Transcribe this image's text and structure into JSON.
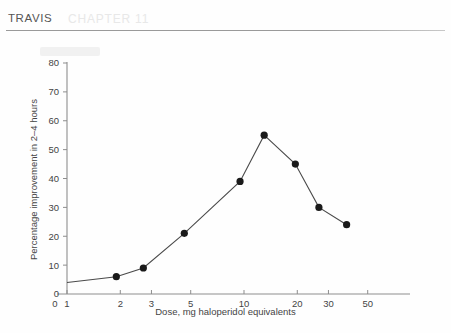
{
  "page": {
    "running_head": "TRAVIS",
    "ghost_watermark": "CHAPTER 11",
    "background_color": "#fefefe",
    "rule_color": "#9a9a9a"
  },
  "chart_data": {
    "type": "line",
    "title": "",
    "subtitle": "",
    "xlabel": "Dose, mg haloperidol equivalents",
    "ylabel": "Percentage improvement in 2–4 hours",
    "xscale": "log",
    "yscale": "linear",
    "xlim": [
      1,
      60
    ],
    "ylim": [
      0,
      80
    ],
    "x_origin_label": "0",
    "xticks": [
      1,
      2,
      3,
      5,
      10,
      20,
      30,
      50
    ],
    "xtick_labels": [
      "1",
      "2",
      "3",
      "5",
      "10",
      "20",
      "30",
      "50"
    ],
    "yticks": [
      0,
      10,
      20,
      30,
      40,
      50,
      60,
      70,
      80
    ],
    "ytick_labels": [
      "0",
      "10",
      "20",
      "30",
      "40",
      "50",
      "60",
      "70",
      "80"
    ],
    "grid": false,
    "legend": null,
    "legend_position": "none",
    "marker": "filled-circle",
    "marker_color": "#1a1a1a",
    "line_color": "#4a4a4a",
    "line_start": {
      "x": 1.0,
      "y": 4
    },
    "x": [
      1.9,
      2.7,
      4.6,
      9.5,
      13.0,
      19.5,
      26.5,
      38.0
    ],
    "y": [
      6,
      9,
      21,
      39,
      55,
      45,
      30,
      24
    ],
    "points": [
      {
        "dose": 1.9,
        "improvement": 6
      },
      {
        "dose": 2.7,
        "improvement": 9
      },
      {
        "dose": 4.6,
        "improvement": 21
      },
      {
        "dose": 9.5,
        "improvement": 39
      },
      {
        "dose": 13.0,
        "improvement": 55
      },
      {
        "dose": 19.5,
        "improvement": 45
      },
      {
        "dose": 26.5,
        "improvement": 30
      },
      {
        "dose": 38.0,
        "improvement": 24
      }
    ],
    "annotations": []
  }
}
